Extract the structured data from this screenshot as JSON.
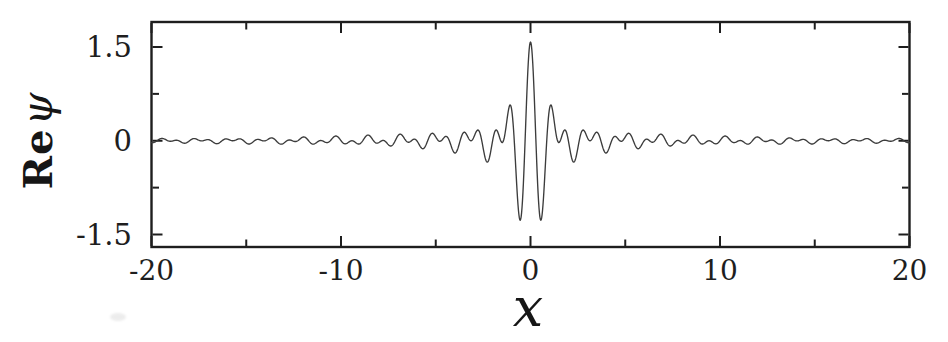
{
  "page": {
    "background": "#ffffff",
    "ink": "#1e1e1e",
    "curve_color": "#3c3c3c"
  },
  "chart_data": {
    "type": "line",
    "title": "",
    "xlabel": "x",
    "ylabel": "Re ψ",
    "ylabel_roman": "Re",
    "ylabel_symbol": "ψ",
    "xlim": [
      -20,
      20
    ],
    "ylim": [
      -1.7,
      1.9
    ],
    "grid": false,
    "legend": null,
    "x_major_ticks": [
      -20,
      -10,
      0,
      10,
      20
    ],
    "x_tick_labels": [
      "-20",
      "-10",
      "0",
      "10",
      "20"
    ],
    "x_minor_ticks": [
      -15,
      -5,
      5,
      15
    ],
    "y_major_ticks": [
      1.5,
      0,
      -1.5
    ],
    "y_tick_labels": [
      "1.5",
      "0",
      "-1.5"
    ],
    "y_minor_ticks": [
      0.75,
      -0.75
    ],
    "curve": {
      "formula": "RePsi(x) = A * (sin(dk*x)/(dk*x)) * cos(k0*x)",
      "A": 1.58,
      "dk": 2.0,
      "k0": 5.5,
      "x_start": -20,
      "x_end": 20,
      "samples": 1700,
      "key_points": [
        {
          "x": 0,
          "y": 1.58
        },
        {
          "x": -0.57,
          "y": -1.22
        },
        {
          "x": 0.57,
          "y": -1.22
        },
        {
          "x": -1.16,
          "y": 0.44
        },
        {
          "x": 1.16,
          "y": 0.44
        },
        {
          "x": -10,
          "envelope_amplitude": 0.08
        },
        {
          "x": 10,
          "envelope_amplitude": 0.08
        },
        {
          "x": -20,
          "envelope_amplitude": 0.04
        },
        {
          "x": 20,
          "envelope_amplitude": 0.04
        }
      ]
    }
  }
}
